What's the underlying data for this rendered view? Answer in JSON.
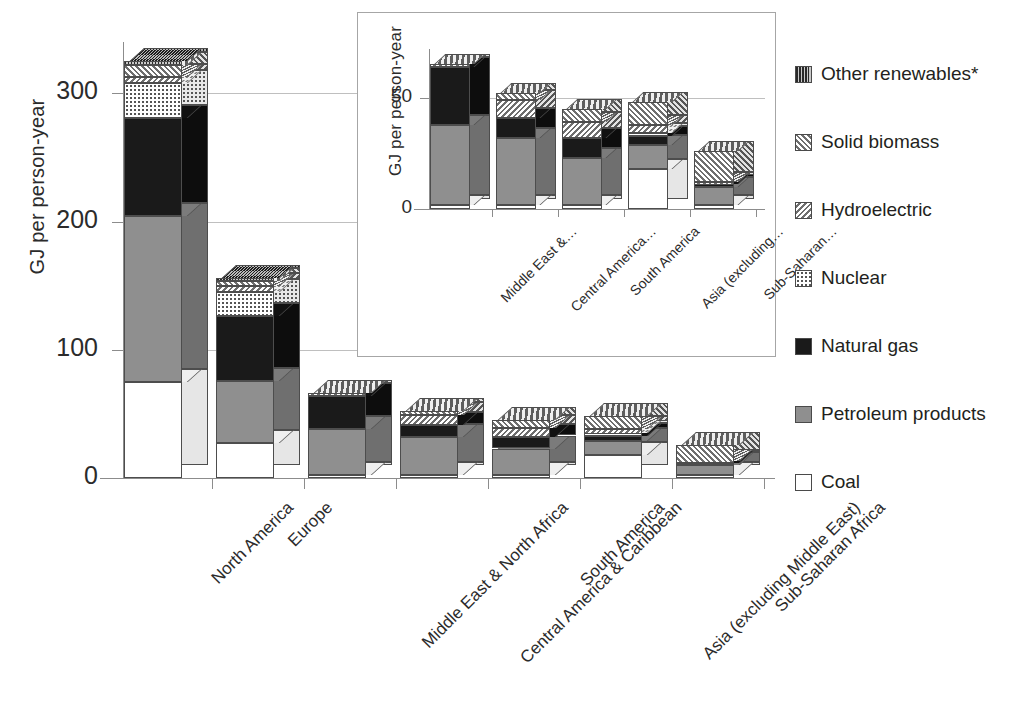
{
  "chart_data": {
    "type": "bar",
    "subtype": "stacked-bar-3d",
    "title": "",
    "ylabel": "GJ per person-year",
    "xlabel": "",
    "ylim": [
      0,
      340
    ],
    "yticks": [
      0,
      100,
      200,
      300
    ],
    "grid": true,
    "legend_position": "right",
    "categories": [
      "North America",
      "Europe",
      "Middle East & North Africa",
      "Central America & Caribbean",
      "South America",
      "Asia (excluding Middle East)",
      "Sub-Saharan Africa"
    ],
    "series": [
      {
        "name": "Coal",
        "values": [
          75,
          27,
          2,
          2,
          2,
          18,
          2
        ]
      },
      {
        "name": "Petroleum products",
        "values": [
          129,
          49,
          36,
          30,
          21,
          11,
          8
        ]
      },
      {
        "name": "Natural gas",
        "values": [
          77,
          50,
          26,
          9,
          9,
          4,
          1
        ]
      },
      {
        "name": "Nuclear",
        "values": [
          27,
          19,
          0,
          0,
          0,
          1,
          0
        ]
      },
      {
        "name": "Hydroelectric",
        "values": [
          5,
          5,
          0,
          8,
          7,
          4,
          1
        ]
      },
      {
        "name": "Solid biomass",
        "values": [
          9,
          4,
          1,
          3,
          6,
          10,
          14
        ]
      },
      {
        "name": "Other renewables*",
        "values": [
          3,
          1,
          0,
          0,
          0,
          0,
          0
        ]
      }
    ],
    "totals": [
      325,
      155,
      65,
      52,
      45,
      48,
      26
    ]
  },
  "inset_chart_data": {
    "type": "bar",
    "subtype": "stacked-bar-3d",
    "ylabel": "GJ per person-year",
    "ylim": [
      0,
      72
    ],
    "yticks": [
      0,
      50
    ],
    "grid": true,
    "categories": [
      "Middle East &…",
      "Central America…",
      "South America",
      "Asia (excluding…",
      "Sub-Saharan…"
    ],
    "series": [
      {
        "name": "Coal",
        "values": [
          2,
          2,
          2,
          18,
          2
        ]
      },
      {
        "name": "Petroleum products",
        "values": [
          36,
          30,
          21,
          11,
          8
        ]
      },
      {
        "name": "Natural gas",
        "values": [
          26,
          9,
          9,
          4,
          1
        ]
      },
      {
        "name": "Nuclear",
        "values": [
          0,
          0,
          0,
          1,
          0
        ]
      },
      {
        "name": "Hydroelectric",
        "values": [
          0,
          8,
          7,
          4,
          1
        ]
      },
      {
        "name": "Solid biomass",
        "values": [
          1,
          3,
          6,
          10,
          14
        ]
      },
      {
        "name": "Other renewables*",
        "values": [
          0,
          0,
          0,
          0,
          0
        ]
      }
    ],
    "totals": [
      65,
      52,
      45,
      48,
      26
    ]
  },
  "axes": {
    "main": {
      "ylabel": "GJ per person-year",
      "ticks": [
        "300",
        "200",
        "100",
        "0"
      ]
    },
    "inset": {
      "ylabel": "GJ per person-year",
      "ticks": [
        "50",
        "0"
      ]
    }
  },
  "legend": {
    "items": [
      {
        "label": "Other renewables*",
        "pattern": "vertical-stripe",
        "key": "other"
      },
      {
        "label": "Solid biomass",
        "pattern": "diagonal-hatch",
        "key": "biomass"
      },
      {
        "label": "Hydroelectric",
        "pattern": "diagonal-hatch-2",
        "key": "hydro"
      },
      {
        "label": "Nuclear",
        "pattern": "dotted",
        "key": "nuclear"
      },
      {
        "label": "Natural gas",
        "pattern": "solid-black",
        "key": "gas"
      },
      {
        "label": "Petroleum products",
        "pattern": "solid-gray",
        "key": "petroleum"
      },
      {
        "label": "Coal",
        "pattern": "outline-white",
        "key": "coal"
      }
    ]
  },
  "colors": {
    "coal": "#ffffff",
    "petroleum": "#8f8f8f",
    "gas": "#1a1a1a",
    "nuclear": "#ffffff",
    "hydro": "#b9b9b9",
    "biomass": "#c2c2c2",
    "other": "#6d6d6d",
    "grid": "#bfbfbf",
    "axis": "#8c8c8c",
    "text": "#231f20"
  }
}
